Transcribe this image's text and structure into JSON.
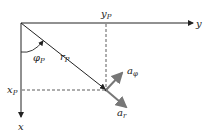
{
  "diagram": {
    "axes": {
      "horizontal_label": "y",
      "vertical_label": "x"
    },
    "point": {
      "x_label": "x",
      "x_sub": "P",
      "y_label": "y",
      "y_sub": "P",
      "r_label": "r",
      "r_sub": "P",
      "phi_label": "φ",
      "phi_sub": "P"
    },
    "unit_vectors": {
      "a_phi_label": "a",
      "a_phi_sub": "φ",
      "a_r_label": "a",
      "a_r_sub": "r"
    },
    "colors": {
      "axis": "#222222",
      "dashed": "#333333",
      "unit_vector": "#777777"
    }
  }
}
